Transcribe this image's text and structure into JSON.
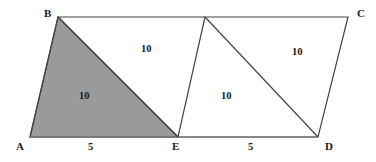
{
  "figure": {
    "type": "geometry-diagram",
    "canvas": {
      "width": 376,
      "height": 162
    },
    "background_color": "#ffffff",
    "stroke_color": "#444444",
    "shaded_fill_color": "#9a9a9a",
    "label_color": "#1a1a1a",
    "points": {
      "A": {
        "x": 30,
        "y": 137,
        "label": "A"
      },
      "B": {
        "x": 58,
        "y": 17,
        "label": "B"
      },
      "E": {
        "x": 178,
        "y": 137,
        "label": "E"
      },
      "D": {
        "x": 318,
        "y": 137,
        "label": "D"
      },
      "C": {
        "x": 348,
        "y": 17,
        "label": "C"
      },
      "F": {
        "x": 205,
        "y": 17,
        "label": ""
      }
    },
    "vertex_labels": [
      {
        "name": "vertex-label-b",
        "text": "B",
        "x": 44,
        "y": 8
      },
      {
        "name": "vertex-label-c",
        "text": "C",
        "x": 357,
        "y": 8
      },
      {
        "name": "vertex-label-a",
        "text": "A",
        "x": 16,
        "y": 141
      },
      {
        "name": "vertex-label-e",
        "text": "E",
        "x": 172,
        "y": 141
      },
      {
        "name": "vertex-label-d",
        "text": "D",
        "x": 325,
        "y": 141
      }
    ],
    "region_labels": [
      {
        "name": "area-label-abe-shaded",
        "text": "10",
        "x": 79,
        "y": 91,
        "region": "triangle-A-B-E",
        "shaded": true
      },
      {
        "name": "area-label-bfe",
        "text": "10",
        "x": 141,
        "y": 44,
        "region": "triangle-B-F-E",
        "shaded": false
      },
      {
        "name": "area-label-fed",
        "text": "10",
        "x": 221,
        "y": 91,
        "region": "triangle-F-E-D",
        "shaded": false
      },
      {
        "name": "area-label-fdc",
        "text": "10",
        "x": 292,
        "y": 47,
        "region": "triangle-F-D-C",
        "shaded": false
      }
    ],
    "length_labels": [
      {
        "name": "length-label-ae",
        "text": "5",
        "x": 88,
        "y": 142,
        "segment": "A-E"
      },
      {
        "name": "length-label-ed",
        "text": "5",
        "x": 248,
        "y": 142,
        "segment": "E-D"
      }
    ],
    "shaded_polygon": {
      "name": "shaded-triangle-abe",
      "points": "30,137 58,17 178,137"
    },
    "outline_polygon": {
      "name": "figure-outline",
      "points": "30,137 58,17 348,17 318,137"
    },
    "interior_segments": [
      {
        "name": "segment-b-e",
        "x1": 58,
        "y1": 17,
        "x2": 178,
        "y2": 137
      },
      {
        "name": "segment-f-e",
        "x1": 205,
        "y1": 17,
        "x2": 178,
        "y2": 137
      },
      {
        "name": "segment-f-d",
        "x1": 205,
        "y1": 17,
        "x2": 318,
        "y2": 137
      }
    ],
    "baseline_segment": {
      "name": "segment-a-d-baseline",
      "x1": 30,
      "y1": 137,
      "x2": 318,
      "y2": 137
    }
  }
}
